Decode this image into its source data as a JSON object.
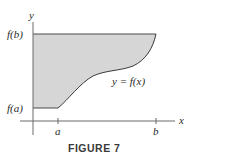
{
  "figure": {
    "caption": "FIGURE 7",
    "axes": {
      "x_label": "x",
      "y_label": "y"
    },
    "x_ticks": [
      "a",
      "b"
    ],
    "y_ticks": [
      "f(a)",
      "f(b)"
    ],
    "curve_label": "y = f(x)",
    "colors": {
      "fill": "#d6d6d6",
      "stroke": "#4a4a4a",
      "axis": "#6a6a6a"
    }
  }
}
